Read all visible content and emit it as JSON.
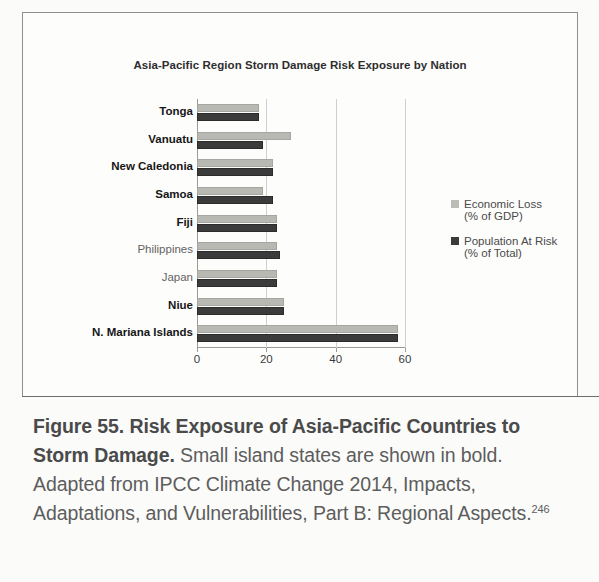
{
  "figure": {
    "caption_bold": "Figure 55. Risk Exposure of Asia-Pacific Countries to Storm Damage.",
    "caption_rest": " Small island states are shown in bold. Adapted from IPCC Climate Change 2014, Impacts, Adaptations, and Vulnerabilities, Part B: Regional Aspects.",
    "caption_footnote": "246"
  },
  "legend": {
    "entries": [
      {
        "name": "Economic Loss",
        "sub": "(% of GDP)",
        "color": "#bcbcb7",
        "swatch": "legend-swatch-light"
      },
      {
        "name": "Population At Risk",
        "sub": "(% of Total)",
        "color": "#3b3b3b",
        "swatch": "legend-swatch-dark"
      }
    ]
  },
  "chart_data": {
    "type": "bar",
    "orientation": "horizontal",
    "title": "Asia-Pacific Region Storm Damage Risk Exposure by Nation",
    "xlabel": "",
    "ylabel": "",
    "xlim": [
      0,
      60
    ],
    "xticks": [
      0,
      20,
      40,
      60
    ],
    "xtick_labels": [
      "0",
      "20",
      "40",
      "60"
    ],
    "grid": true,
    "grid_axis": "x",
    "legend_position": "right",
    "categories": [
      "Tonga",
      "Vanuatu",
      "New Caledonia",
      "Samoa",
      "Fiji",
      "Philippines",
      "Japan",
      "Niue",
      "N. Mariana Islands"
    ],
    "category_emphasis": [
      "bold",
      "bold",
      "bold",
      "bold",
      "bold",
      "normal",
      "normal",
      "bold",
      "bold"
    ],
    "series": [
      {
        "name": "Economic Loss (% of GDP)",
        "color": "#b9b9b4",
        "values": [
          18,
          27,
          22,
          19,
          23,
          23,
          23,
          25,
          58
        ]
      },
      {
        "name": "Population At Risk (% of Total)",
        "color": "#3b3b3b",
        "values": [
          18,
          19,
          22,
          22,
          23,
          24,
          23,
          25,
          58
        ]
      }
    ]
  }
}
